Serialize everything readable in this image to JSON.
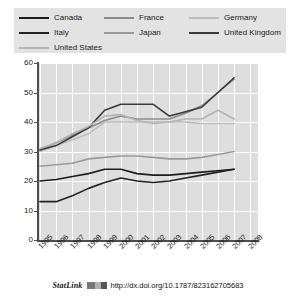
{
  "legend": {
    "items": [
      {
        "label": "Canada",
        "color": "#1c1c1c",
        "row": 0,
        "col": 0
      },
      {
        "label": "France",
        "color": "#8c8c8c",
        "row": 0,
        "col": 1
      },
      {
        "label": "Germany",
        "color": "#bcbcbc",
        "row": 0,
        "col": 2
      },
      {
        "label": "Italy",
        "color": "#232323",
        "row": 1,
        "col": 0
      },
      {
        "label": "Japan",
        "color": "#9a9a9a",
        "row": 1,
        "col": 1
      },
      {
        "label": "United Kingdom",
        "color": "#3a3a3a",
        "row": 1,
        "col": 2
      },
      {
        "label": "United States",
        "color": "#b4b4b4",
        "row": 2,
        "col": 0
      }
    ]
  },
  "footer": {
    "statlink_label": "StatLink",
    "doi_url": "http://dx.doi.org/10.1787/823162705683"
  },
  "chart_data": {
    "type": "line",
    "title": "",
    "xlabel": "",
    "ylabel": "",
    "ylim": [
      0,
      60
    ],
    "yticks": [
      0,
      10,
      20,
      30,
      40,
      50,
      60
    ],
    "grid": true,
    "legend_position": "top",
    "categories": [
      "1995",
      "1996",
      "1997",
      "1998",
      "1999",
      "2000",
      "2001",
      "2002",
      "2003",
      "2004",
      "2005",
      "2006",
      "2007",
      "2008"
    ],
    "series": [
      {
        "name": "Canada",
        "color": "#1c1c1c",
        "values": [
          20.0,
          20.5,
          21.5,
          22.5,
          24.0,
          24.0,
          22.5,
          22.0,
          22.0,
          22.5,
          23.0,
          23.5,
          24.0,
          null
        ]
      },
      {
        "name": "France",
        "color": "#8c8c8c",
        "values": [
          30.5,
          33.0,
          35.5,
          38.0,
          40.5,
          42.0,
          41.0,
          41.0,
          41.0,
          43.0,
          45.5,
          50.0,
          54.5,
          null
        ]
      },
      {
        "name": "Germany",
        "color": "#bcbcbc",
        "values": [
          30.0,
          32.0,
          34.0,
          36.0,
          40.0,
          40.0,
          40.0,
          40.0,
          40.0,
          40.0,
          39.5,
          39.5,
          39.5,
          null
        ]
      },
      {
        "name": "Italy",
        "color": "#232323",
        "values": [
          13.0,
          13.0,
          15.0,
          17.5,
          19.5,
          21.0,
          20.0,
          19.5,
          20.0,
          21.0,
          22.0,
          23.0,
          24.0,
          null
        ]
      },
      {
        "name": "Japan",
        "color": "#9a9a9a",
        "values": [
          25.0,
          25.5,
          26.0,
          27.5,
          28.0,
          28.5,
          28.5,
          28.0,
          27.5,
          27.5,
          28.0,
          29.0,
          30.0,
          null
        ]
      },
      {
        "name": "United Kingdom",
        "color": "#3a3a3a",
        "values": [
          30.5,
          32.0,
          35.0,
          38.0,
          44.0,
          46.0,
          46.0,
          46.0,
          42.0,
          43.5,
          45.0,
          50.0,
          55.0,
          null
        ]
      },
      {
        "name": "United States",
        "color": "#b4b4b4",
        "values": [
          31.0,
          33.0,
          36.0,
          38.5,
          42.0,
          42.5,
          40.5,
          39.5,
          40.0,
          41.0,
          41.0,
          44.0,
          41.0,
          null
        ]
      }
    ]
  }
}
